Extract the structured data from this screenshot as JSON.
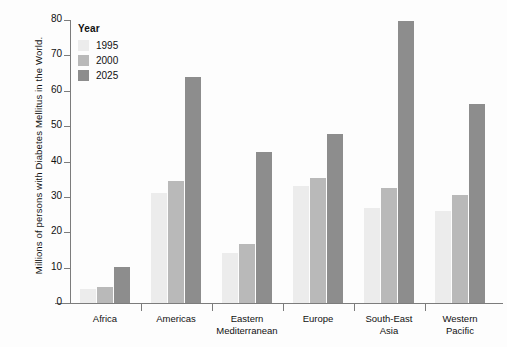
{
  "chart_data": {
    "type": "bar",
    "title": "",
    "xlabel": "",
    "ylabel": "Millions of persons with Diabetes Mellitus in the World.",
    "ylim": [
      0,
      80
    ],
    "yticks": [
      0,
      10,
      20,
      30,
      40,
      50,
      60,
      70,
      80
    ],
    "grid": false,
    "legend_position": "top-left",
    "legend_title": "Year",
    "categories": [
      "Africa",
      "Americas",
      "Eastern Mediterranean",
      "Europe",
      "South-East Asia",
      "Western Pacific"
    ],
    "series": [
      {
        "name": "1995",
        "color": "#ececec",
        "values": [
          4.0,
          31.0,
          14.0,
          33.0,
          27.0,
          26.0
        ]
      },
      {
        "name": "2000",
        "color": "#b9b9b9",
        "values": [
          4.4,
          34.6,
          16.6,
          35.3,
          32.6,
          30.4
        ]
      },
      {
        "name": "2025",
        "color": "#8d8d8d",
        "values": [
          10.2,
          63.8,
          42.8,
          47.7,
          79.6,
          56.3
        ]
      }
    ]
  },
  "axis": {
    "y_title": "Millions of persons with Diabetes Mellitus in the World."
  }
}
